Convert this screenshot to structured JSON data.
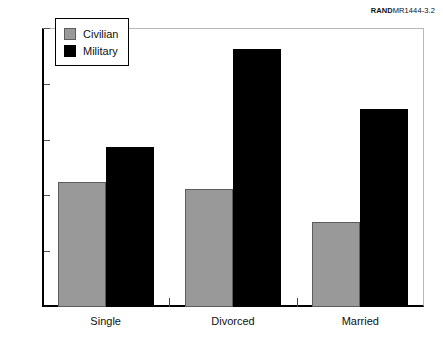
{
  "source_tag": {
    "brand": "RAND",
    "code": "MR1444-3.2"
  },
  "chart_data": {
    "type": "bar",
    "title": "",
    "subtitle": "",
    "xlabel": "",
    "ylabel": "",
    "categories": [
      "Single",
      "Divorced",
      "Married"
    ],
    "series": [
      {
        "name": "Civilian",
        "color": "#999999",
        "values": [
          11.2,
          10.6,
          7.6
        ]
      },
      {
        "name": "Military",
        "color": "#000000",
        "values": [
          14.3,
          23.1,
          17.7
        ]
      }
    ],
    "ylim": [
      0,
      25
    ],
    "yticks": [
      0,
      5,
      10,
      15,
      20,
      25
    ],
    "ytick_labels": [
      "0",
      "5",
      "10",
      "15",
      "20",
      "25"
    ],
    "grid": false,
    "legend_position": "upper-left-inside",
    "annotations": []
  },
  "legend": {
    "entries": [
      {
        "label": "Civilian",
        "swatch": "civilian-swatch"
      },
      {
        "label": "Military",
        "swatch": "military-swatch"
      }
    ]
  }
}
